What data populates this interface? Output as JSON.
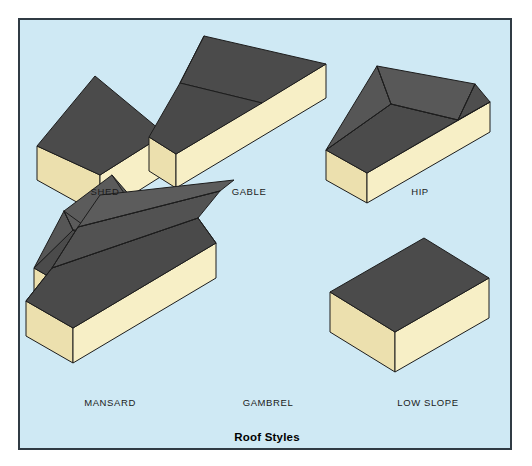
{
  "figure": {
    "caption": "Roof Styles",
    "background_color": "#cfe9f4",
    "frame_color": "#303b44",
    "page_color": "#ffffff"
  },
  "palette": {
    "roof_dark": "#4a4a4a",
    "roof_mid": "#525252",
    "roof_light": "#5c5c5c",
    "wall_light": "#f6eec2",
    "wall_shade": "#e7dcab",
    "outline": "#1d1d1d",
    "label_text": "#1b1b1b"
  },
  "roof_styles": [
    {
      "id": "shed",
      "label": "SHED",
      "label_x": 85,
      "label_y": 172,
      "description": "single sloping plane"
    },
    {
      "id": "gable",
      "label": "GABLE",
      "label_x": 229,
      "label_y": 172,
      "description": "two slopes meeting at a ridge"
    },
    {
      "id": "hip",
      "label": "HIP",
      "label_x": 400,
      "label_y": 172,
      "description": "slopes on all four sides"
    },
    {
      "id": "mansard",
      "label": "MANSARD",
      "label_x": 90,
      "label_y": 383,
      "description": "steep lower slope with flatter upper deck"
    },
    {
      "id": "gambrel",
      "label": "GAMBREL",
      "label_x": 248,
      "label_y": 383,
      "description": "two pitches per side, barn style"
    },
    {
      "id": "low-slope",
      "label": "LOW SLOPE",
      "label_x": 408,
      "label_y": 383,
      "description": "nearly flat deck"
    }
  ]
}
